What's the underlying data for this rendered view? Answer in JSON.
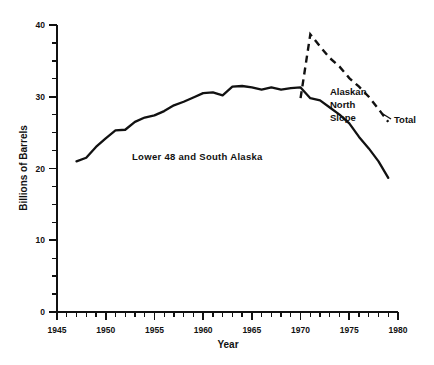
{
  "chart_data": {
    "type": "line",
    "title": "",
    "xlabel": "Year",
    "ylabel": "Billions of Barrels",
    "xlim": [
      1945,
      1980
    ],
    "ylim": [
      0,
      40
    ],
    "grid": false,
    "legend": "none",
    "x_ticks_major": [
      1945,
      1950,
      1955,
      1960,
      1965,
      1970,
      1975,
      1980
    ],
    "x_tick_labels": [
      "1945",
      "1950",
      "1955",
      "1960",
      "1965",
      "1970",
      "1975",
      "1980"
    ],
    "x_tick_minor_step": 1,
    "y_ticks_major": [
      0,
      10,
      20,
      30,
      40
    ],
    "y_tick_labels": [
      "0",
      "10",
      "20",
      "30",
      "40"
    ],
    "y_tick_minor_step": 2.5,
    "series": [
      {
        "name": "Lower 48 and South Alaska",
        "style": "solid",
        "x": [
          1947,
          1948,
          1949,
          1950,
          1951,
          1952,
          1953,
          1954,
          1955,
          1956,
          1957,
          1958,
          1959,
          1960,
          1961,
          1962,
          1963,
          1964,
          1965,
          1966,
          1967,
          1968,
          1969,
          1970,
          1971,
          1972,
          1973,
          1974,
          1975,
          1976,
          1977,
          1978,
          1979
        ],
        "values": [
          21.0,
          21.5,
          23.0,
          24.2,
          25.3,
          25.4,
          26.5,
          27.1,
          27.4,
          28.0,
          28.8,
          29.3,
          29.9,
          30.5,
          30.6,
          30.2,
          31.4,
          31.5,
          31.3,
          31.0,
          31.3,
          31.0,
          31.2,
          31.3,
          29.8,
          29.5,
          28.5,
          27.5,
          26.3,
          24.4,
          22.8,
          21.0,
          18.7
        ]
      },
      {
        "name": "Total",
        "style": "dashed",
        "x": [
          1970,
          1971,
          1972,
          1973,
          1974,
          1975,
          1976,
          1977,
          1978,
          1979
        ],
        "values": [
          29.8,
          38.7,
          37.0,
          35.4,
          34.2,
          32.6,
          31.4,
          30.0,
          28.3,
          26.5
        ]
      }
    ],
    "annotations": [
      {
        "name": "lower-48-and-south-alaska",
        "text": "Lower 48 and South Alaska",
        "x_px": 132,
        "y_px": 160
      },
      {
        "name": "alaskan-north-slope",
        "lines": [
          "Alaskan",
          "North",
          "Slope"
        ],
        "x_px": 330,
        "y_px": 95
      },
      {
        "name": "total",
        "text": "Total",
        "x_px": 394,
        "y_px": 123
      }
    ]
  }
}
